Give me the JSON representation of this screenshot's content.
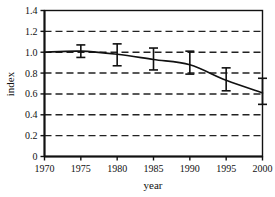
{
  "chart_data": {
    "type": "line",
    "title": "",
    "subtitle": "",
    "xlabel": "year",
    "ylabel": "index",
    "xlim": [
      1970,
      2000
    ],
    "ylim": [
      0,
      1.4
    ],
    "grid": true,
    "grid_style": "dashed-horizontal",
    "legend": null,
    "legend_position": "none",
    "xticks": [
      1970,
      1975,
      1980,
      1985,
      1990,
      1995,
      2000
    ],
    "xtick_labels": [
      "1970",
      "1975",
      "1980",
      "1985",
      "1990",
      "1995",
      "2000"
    ],
    "yticks": [
      0,
      0.2,
      0.4,
      0.6,
      0.8,
      1.0,
      1.2,
      1.4
    ],
    "ytick_labels": [
      "0",
      "0.2",
      "0.4",
      "0.6",
      "0.8",
      "1.0",
      "1.2",
      "1.4"
    ],
    "series": [
      {
        "name": "index",
        "x": [
          1970,
          1975,
          1980,
          1985,
          1990,
          1995,
          2000
        ],
        "values": [
          1.0,
          1.01,
          0.98,
          0.93,
          0.88,
          0.73,
          0.61
        ],
        "line_color": "#111111",
        "line_width": 1.6,
        "marker": "none"
      }
    ],
    "error_bars": [
      {
        "x": 1975,
        "y": 1.01,
        "low": 0.95,
        "high": 1.07
      },
      {
        "x": 1980,
        "y": 0.98,
        "low": 0.87,
        "high": 1.08
      },
      {
        "x": 1985,
        "y": 0.93,
        "low": 0.83,
        "high": 1.04
      },
      {
        "x": 1990,
        "y": 0.88,
        "low": 0.79,
        "high": 1.01
      },
      {
        "x": 1995,
        "y": 0.73,
        "low": 0.63,
        "high": 0.85
      },
      {
        "x": 2000,
        "y": 0.61,
        "low": 0.5,
        "high": 0.75
      }
    ],
    "colors": {
      "axis": "#111111",
      "grid": "#222222",
      "line": "#111111",
      "error_bar": "#111111",
      "background": "#ffffff"
    }
  }
}
